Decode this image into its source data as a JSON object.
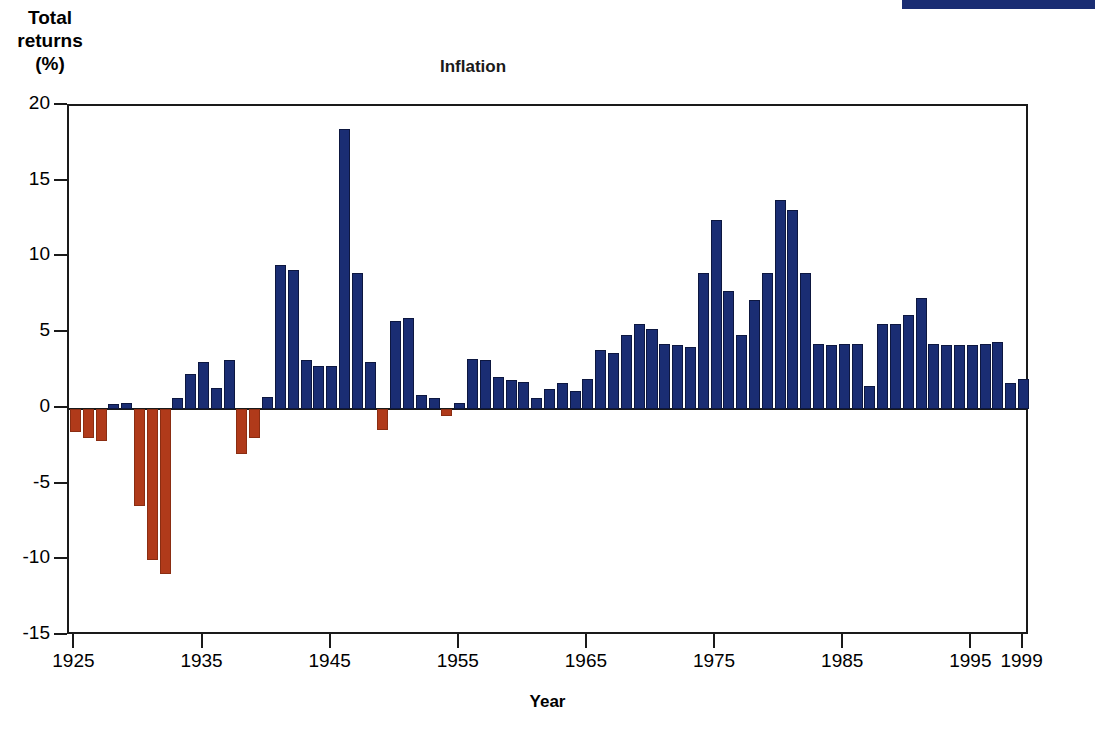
{
  "top_bar": {
    "color": "#1a2d73"
  },
  "axis_caption": {
    "line1": "Total",
    "line2": "returns",
    "line3": "(%)"
  },
  "chart_data": {
    "type": "bar",
    "title": "Inflation",
    "xlabel": "Year",
    "ylabel": "Total returns (%)",
    "ylim": [
      -15,
      20
    ],
    "xlim": [
      1925,
      1999
    ],
    "grid": false,
    "legend": "none",
    "yticks": [
      20,
      15,
      10,
      5,
      0,
      -5,
      -10,
      -15
    ],
    "ytick_labels": [
      "20",
      "15",
      "10",
      "5",
      "0",
      "-5",
      "-10",
      "-15"
    ],
    "xticks": [
      1925,
      1935,
      1945,
      1955,
      1965,
      1975,
      1985,
      1995,
      1999
    ],
    "xtick_labels": [
      "1925",
      "1935",
      "1945",
      "1955",
      "1965",
      "1975",
      "1985",
      "1995",
      "1999"
    ],
    "positive_color": "#1a2d73",
    "negative_color": "#b03a1a",
    "categories": [
      1925,
      1926,
      1927,
      1928,
      1929,
      1930,
      1931,
      1932,
      1933,
      1934,
      1935,
      1936,
      1937,
      1938,
      1939,
      1940,
      1941,
      1942,
      1943,
      1944,
      1945,
      1946,
      1947,
      1948,
      1949,
      1950,
      1951,
      1952,
      1953,
      1954,
      1955,
      1956,
      1957,
      1958,
      1959,
      1960,
      1961,
      1962,
      1963,
      1964,
      1965,
      1966,
      1967,
      1968,
      1969,
      1970,
      1971,
      1972,
      1973,
      1974,
      1975,
      1976,
      1977,
      1978,
      1979,
      1980,
      1981,
      1982,
      1983,
      1984,
      1985,
      1986,
      1987,
      1988,
      1989,
      1990,
      1991,
      1992,
      1993,
      1994,
      1995,
      1996,
      1997,
      1998,
      1999
    ],
    "values": [
      -1.5,
      -1.9,
      -2.1,
      0.3,
      0.4,
      -6.4,
      -10.0,
      -10.9,
      0.7,
      2.3,
      3.1,
      1.4,
      3.2,
      -3.0,
      -1.9,
      0.8,
      9.5,
      9.2,
      3.2,
      2.8,
      2.8,
      18.5,
      9.0,
      3.1,
      -1.4,
      5.8,
      6.0,
      0.9,
      0.7,
      -0.5,
      0.4,
      3.3,
      3.2,
      2.1,
      1.9,
      1.8,
      0.7,
      1.3,
      1.7,
      1.2,
      2.0,
      3.9,
      3.7,
      4.9,
      5.6,
      5.3,
      4.3,
      4.2,
      4.1,
      9.0,
      12.5,
      7.8,
      4.9,
      7.2,
      9.0,
      13.8,
      13.1,
      9.0,
      4.3,
      4.2,
      4.3,
      4.3,
      1.5,
      5.6,
      5.6,
      6.2,
      7.3,
      4.3,
      4.2,
      4.2,
      4.2,
      4.3,
      4.4,
      1.7,
      2.0
    ]
  }
}
